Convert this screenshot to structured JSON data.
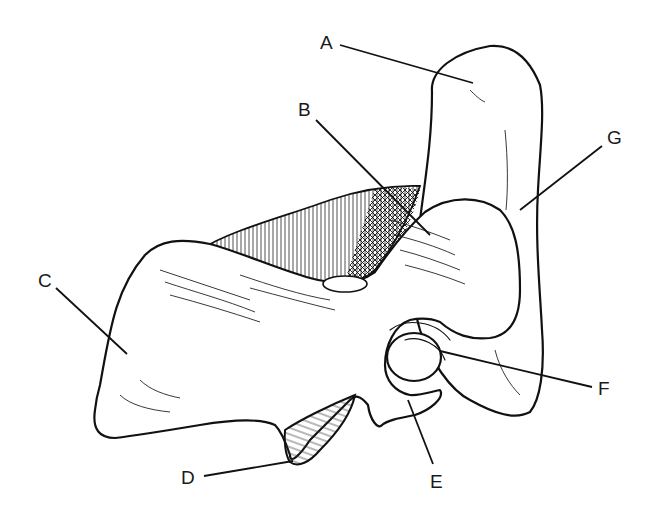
{
  "diagram": {
    "labels": [
      {
        "id": "A",
        "text": "A",
        "x": 320,
        "y": 33
      },
      {
        "id": "B",
        "text": "B",
        "x": 298,
        "y": 100
      },
      {
        "id": "C",
        "text": "C",
        "x": 38,
        "y": 271
      },
      {
        "id": "D",
        "text": "D",
        "x": 181,
        "y": 470
      },
      {
        "id": "E",
        "text": "E",
        "x": 430,
        "y": 474
      },
      {
        "id": "F",
        "text": "F",
        "x": 598,
        "y": 380
      },
      {
        "id": "G",
        "text": "G",
        "x": 607,
        "y": 128
      }
    ],
    "colors": {
      "line": "#111111",
      "background": "#ffffff"
    }
  }
}
